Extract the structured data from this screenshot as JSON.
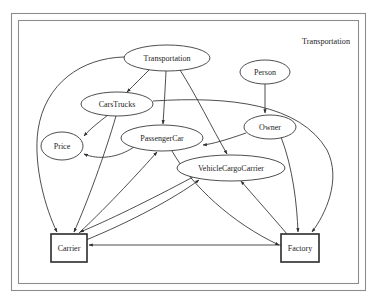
{
  "diagram": {
    "title": "Transportation",
    "title_position": "top-right",
    "background_color": "#ffffff",
    "frame": {
      "outer": {
        "x": 11,
        "y": 13,
        "width": 355,
        "height": 278,
        "stroke": "#8d8d8d"
      },
      "inner": {
        "x": 18,
        "y": 20,
        "width": 341,
        "height": 264,
        "stroke": "#8d8d8d"
      }
    },
    "node_shapes": {
      "ellipse": "class-or-concept",
      "rectangle": "emphasized-entity"
    },
    "nodes": [
      {
        "id": "transportation",
        "label": "Transportation",
        "shape": "ellipse",
        "cx": 167,
        "cy": 58,
        "rx": 43,
        "ry": 13
      },
      {
        "id": "person",
        "label": "Person",
        "shape": "ellipse",
        "cx": 265,
        "cy": 72,
        "rx": 25,
        "ry": 12
      },
      {
        "id": "carstrucks",
        "label": "CarsTrucks",
        "shape": "ellipse",
        "cx": 117,
        "cy": 104,
        "rx": 36,
        "ry": 12
      },
      {
        "id": "owner",
        "label": "Owner",
        "shape": "ellipse",
        "cx": 270,
        "cy": 127,
        "rx": 26,
        "ry": 12
      },
      {
        "id": "passengercar",
        "label": "PassengerCar",
        "shape": "ellipse",
        "cx": 162,
        "cy": 138,
        "rx": 41,
        "ry": 13
      },
      {
        "id": "price",
        "label": "Price",
        "shape": "ellipse",
        "cx": 62,
        "cy": 146,
        "rx": 21,
        "ry": 14
      },
      {
        "id": "vehiclecargocarrier",
        "label": "VehicleCargoCarrier",
        "shape": "ellipse",
        "cx": 231,
        "cy": 168,
        "rx": 54,
        "ry": 13
      },
      {
        "id": "carrier",
        "label": "Carrier",
        "shape": "rect",
        "x": 51,
        "y": 234,
        "width": 36,
        "height": 28
      },
      {
        "id": "factory",
        "label": "Factory",
        "shape": "rect",
        "x": 281,
        "y": 234,
        "width": 38,
        "height": 28
      }
    ],
    "edges": [
      {
        "from": "transportation",
        "to": "carstrucks",
        "arrow": true
      },
      {
        "from": "transportation",
        "to": "passengercar",
        "arrow": true
      },
      {
        "from": "transportation",
        "to": "vehiclecargocarrier",
        "arrow": true
      },
      {
        "from": "transportation",
        "to": "carrier",
        "arrow": true
      },
      {
        "from": "person",
        "to": "owner",
        "arrow": true
      },
      {
        "from": "carstrucks",
        "to": "price",
        "arrow": true
      },
      {
        "from": "carstrucks",
        "to": "carrier",
        "arrow": true
      },
      {
        "from": "carstrucks",
        "to": "factory",
        "arrow": true
      },
      {
        "from": "passengercar",
        "to": "price",
        "arrow": true
      },
      {
        "from": "passengercar",
        "to": "factory",
        "arrow": true
      },
      {
        "from": "owner",
        "to": "passengercar",
        "arrow": true
      },
      {
        "from": "owner",
        "to": "factory",
        "arrow": true
      },
      {
        "from": "carrier",
        "to": "passengercar",
        "arrow": true
      },
      {
        "from": "carrier",
        "to": "vehiclecargocarrier",
        "arrow": true
      },
      {
        "from": "factory",
        "to": "carrier",
        "arrow": true
      },
      {
        "from": "factory",
        "to": "vehiclecargocarrier",
        "arrow": true
      },
      {
        "from": "vehiclecargocarrier",
        "to": "carrier",
        "arrow": true
      }
    ]
  }
}
